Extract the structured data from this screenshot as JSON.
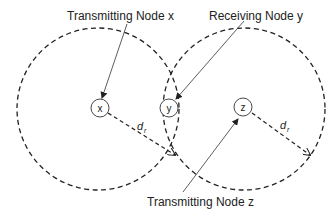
{
  "diagram": {
    "labels": {
      "transmitting_x": "Transmitting Node x",
      "receiving_y": "Receiving Node y",
      "transmitting_z": "Transmitting Node z"
    },
    "nodes": [
      {
        "id": "x",
        "label": "x"
      },
      {
        "id": "y",
        "label": "y"
      },
      {
        "id": "z",
        "label": "z"
      }
    ],
    "range_label": "d",
    "range_subscript": "r",
    "colors": {
      "line": "#222222",
      "background": "#ffffff"
    }
  }
}
